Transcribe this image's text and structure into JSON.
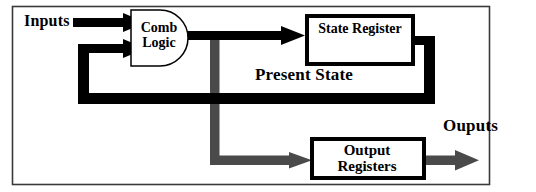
{
  "diagram": {
    "frame": {
      "stroke": "#3a3a3a"
    },
    "colors": {
      "signal_black": "#000000",
      "clock_gray": "#4a4a4a",
      "box_border": "#000000",
      "background": "#ffffff",
      "frame_border": "#3a3a3a"
    },
    "labels": {
      "inputs": "Inputs",
      "present_state": "Present State",
      "outputs": "Ouputs"
    },
    "blocks": {
      "comb_logic": {
        "line1": "Comb",
        "line2": "Logic",
        "shape": "d-shape"
      },
      "state_register": {
        "line1": "State  Register",
        "shape": "rectangle"
      },
      "output_registers": {
        "line1": "Output",
        "line2": "Registers",
        "shape": "rectangle"
      }
    },
    "signals": [
      {
        "name": "inputs-arrow-top",
        "color": "#000000",
        "kind": "arrow"
      },
      {
        "name": "feedback-arrow-into-comb-logic",
        "color": "#000000",
        "kind": "arrow"
      },
      {
        "name": "comb-logic-to-state-register-arrow",
        "color": "#000000",
        "kind": "arrow"
      },
      {
        "name": "present-state-feedback-path",
        "color": "#000000",
        "kind": "line"
      },
      {
        "name": "clock-distribution-line",
        "color": "#4a4a4a",
        "kind": "line"
      },
      {
        "name": "clock-to-output-registers-arrow",
        "color": "#4a4a4a",
        "kind": "arrow"
      },
      {
        "name": "outputs-arrow",
        "color": "#4a4a4a",
        "kind": "arrow"
      }
    ]
  }
}
